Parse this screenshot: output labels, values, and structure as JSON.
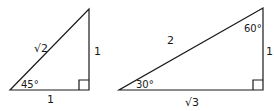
{
  "triangles": [
    {
      "name": "45-45-90 triangle",
      "hypotenuse_label": "√2",
      "vertical_leg_label": "1",
      "horizontal_leg_label": "1",
      "angle_label": "45°",
      "vertices": {
        "left": [
          10,
          90
        ],
        "right_angle": [
          89,
          90
        ],
        "top": [
          89,
          9
        ]
      }
    },
    {
      "name": "30-60-90 triangle",
      "hypotenuse_label": "2",
      "vertical_leg_label": "1",
      "horizontal_leg_label": "√3",
      "bottom_angle_label": "30°",
      "top_angle_label": "60°",
      "vertices": {
        "left": [
          119,
          90
        ],
        "right_angle": [
          263,
          90
        ],
        "top": [
          263,
          8
        ]
      }
    }
  ],
  "colors": {
    "stroke": "#1a1a1a",
    "background": "#ffffff"
  }
}
